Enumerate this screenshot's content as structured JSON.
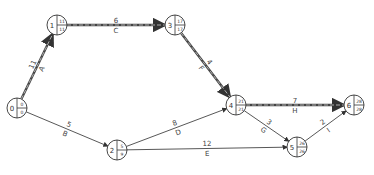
{
  "diagram": {
    "type": "activity-on-arrow network (critical path)",
    "nodes": [
      {
        "id": "0",
        "earliest": "0",
        "latest": "0",
        "x": 17,
        "y": 108
      },
      {
        "id": "1",
        "earliest": "11",
        "latest": "11",
        "x": 57,
        "y": 25
      },
      {
        "id": "2",
        "earliest": "5",
        "latest": "9",
        "x": 117,
        "y": 150
      },
      {
        "id": "3",
        "earliest": "17",
        "latest": "17",
        "x": 175,
        "y": 25
      },
      {
        "id": "4",
        "earliest": "21",
        "latest": "21",
        "x": 236,
        "y": 105
      },
      {
        "id": "5",
        "earliest": "26",
        "latest": "26",
        "x": 297,
        "y": 147
      },
      {
        "id": "6",
        "earliest": "28",
        "latest": "28",
        "x": 354,
        "y": 105
      }
    ],
    "activities": [
      {
        "name": "A",
        "duration": "11",
        "from": "0",
        "to": "1",
        "critical": true
      },
      {
        "name": "B",
        "duration": "5",
        "from": "0",
        "to": "2",
        "critical": false
      },
      {
        "name": "C",
        "duration": "6",
        "from": "1",
        "to": "3",
        "critical": true
      },
      {
        "name": "D",
        "duration": "8",
        "from": "2",
        "to": "4",
        "critical": false
      },
      {
        "name": "E",
        "duration": "12",
        "from": "2",
        "to": "5",
        "critical": false
      },
      {
        "name": "F",
        "duration": "4",
        "from": "3",
        "to": "4",
        "critical": true
      },
      {
        "name": "G",
        "duration": "3",
        "from": "4",
        "to": "5",
        "critical": false
      },
      {
        "name": "H",
        "duration": "7",
        "from": "4",
        "to": "6",
        "critical": true
      },
      {
        "name": "I",
        "duration": "2",
        "from": "5",
        "to": "6",
        "critical": false
      }
    ],
    "colors": {
      "line": "#444444",
      "critical_dash": "#bbbbbb",
      "background": "#ffffff"
    }
  }
}
